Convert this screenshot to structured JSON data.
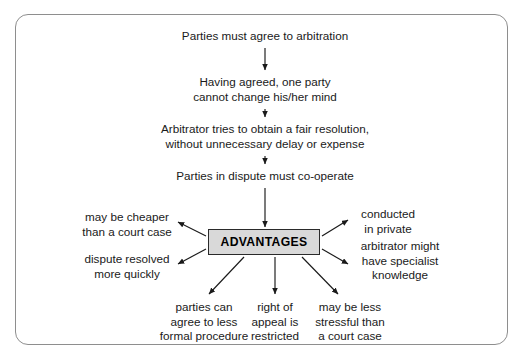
{
  "diagram": {
    "flow_steps": [
      {
        "id": "step-1",
        "lines": [
          "Parties must agree to arbitration"
        ]
      },
      {
        "id": "step-2",
        "lines": [
          "Having agreed, one party",
          "cannot change his/her mind"
        ]
      },
      {
        "id": "step-3",
        "lines": [
          "Arbitrator tries to obtain a fair resolution,",
          "without unnecessary delay or expense"
        ]
      },
      {
        "id": "step-4",
        "lines": [
          "Parties in dispute must co-operate"
        ]
      }
    ],
    "central_node": {
      "label": "ADVANTAGES",
      "fill_color": "#d9d9d9",
      "border_color": "#2a2a2a"
    },
    "advantages": [
      {
        "id": "adv-cheaper",
        "lines": [
          "may be cheaper",
          "than a court case"
        ]
      },
      {
        "id": "adv-quick",
        "lines": [
          "dispute resolved",
          "more quickly"
        ]
      },
      {
        "id": "adv-private",
        "lines": [
          "conducted",
          "in private"
        ]
      },
      {
        "id": "adv-specialist",
        "lines": [
          "arbitrator might",
          "have specialist",
          "knowledge"
        ]
      },
      {
        "id": "adv-informal",
        "lines": [
          "parties can",
          "agree to less",
          "formal procedure"
        ]
      },
      {
        "id": "adv-appeal",
        "lines": [
          "right of",
          "appeal is",
          "restricted"
        ]
      },
      {
        "id": "adv-stressful",
        "lines": [
          "may be less",
          "stressful than",
          "a court case"
        ]
      }
    ],
    "connector_color": "#1a1a1a",
    "frame_border_color": "#8e8e8e"
  }
}
